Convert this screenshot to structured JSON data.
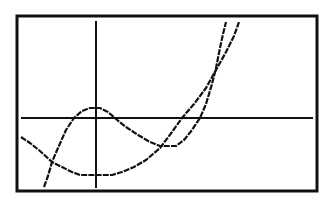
{
  "screen": {
    "type": "graphing-calculator-plot",
    "background": "#ffffff",
    "ink": "#111111",
    "frame": {
      "x": 17,
      "y": 16,
      "w": 300,
      "h": 175
    }
  },
  "axes": {
    "x_axis": {
      "y": 118,
      "x1": 21,
      "x2": 313
    },
    "y_axis": {
      "x": 96,
      "y1": 21,
      "y2": 188
    }
  },
  "curves": [
    {
      "name": "parabola",
      "points": "21,137 30,143 40,151 52,162 62,167 72,172 80,175 112,175 122,172 134,167 146,160 160,148 172,132 182,118 194,104 206,88 216,70 226,52 234,36 239,22"
    },
    {
      "name": "cubic",
      "points": "44,187 48,176 52,162 58,148 66,130 74,118 82,111 90,108 100,108 108,112 116,119 126,127 138,135 150,142 160,146 176,146 184,140 192,130 200,118 206,104 212,84 216,68 220,48 223,34 226,22"
    }
  ]
}
